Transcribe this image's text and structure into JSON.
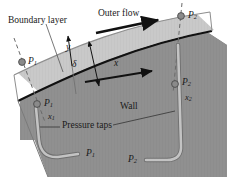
{
  "figure": {
    "colors": {
      "background": "#ffffff",
      "outer_flow_region": "#ffffff",
      "boundary_layer_fill": "#c8c8c8",
      "wall_fill": "#8f8f8f",
      "wall_surface_line": "#111111",
      "tube_fill": "#b5b5b5",
      "tube_stroke": "#6f6f6f",
      "dot_fill": "#8a8a8a",
      "dot_stroke": "#4a4a4a",
      "dashed_line": "#6a6a6a",
      "text": "#1a1a1a",
      "arrow": "#111111"
    },
    "labels": {
      "boundary_layer": "Boundary layer",
      "outer_flow": "Outer flow",
      "wall": "Wall",
      "pressure_taps": "Pressure taps",
      "y_axis": "y",
      "x_axis": "x",
      "delta": "δ",
      "p1_outer": "P",
      "p1_outer_sub": "1",
      "p1_wall": "P",
      "p1_wall_sub": "1",
      "p2_outer": "P",
      "p2_outer_sub": "2",
      "p2_wall": "P",
      "p2_wall_sub": "2",
      "x1": "x",
      "x1_sub": "1",
      "x2": "x",
      "x2_sub": "2",
      "p1_tube": "P",
      "p1_tube_sub": "1",
      "p2_tube": "P",
      "p2_tube_sub": "2"
    }
  }
}
